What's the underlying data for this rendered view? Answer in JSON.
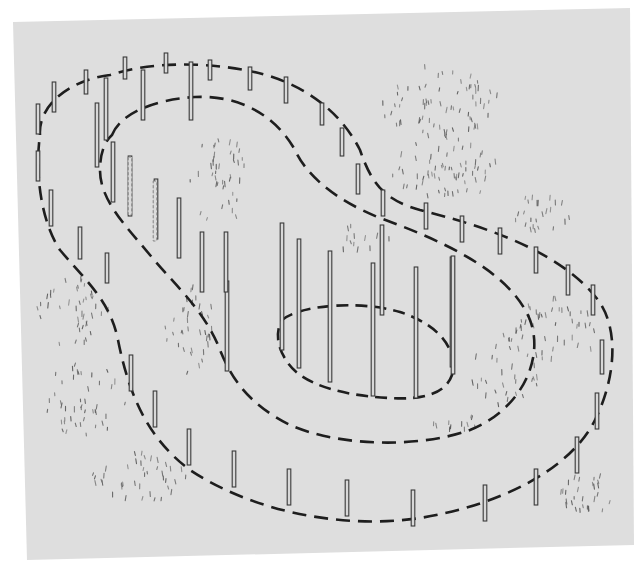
{
  "figure": {
    "kind": "contour-stake-diagram",
    "colors": {
      "page": "#ffffff",
      "panel": "#dedede",
      "line": "#1e1e1e",
      "pole_fill": "#d8d8d8",
      "pole_stroke": "#3a3a3a",
      "tuft": "#5a5a5a"
    }
  },
  "panel": {
    "corners": [
      [
        13,
        22
      ],
      [
        630,
        8
      ],
      [
        634,
        545
      ],
      [
        27,
        560
      ]
    ]
  },
  "contours": [
    {
      "name": "outer-contour",
      "dash": "14 8",
      "path": "M 40 135 C 38 105, 70 80, 110 75 C 150 62, 200 62, 245 70 C 300 80, 340 110, 360 150 C 372 185, 385 200, 420 210 C 480 225, 560 250, 598 300 C 620 330, 615 380, 595 420 C 570 470, 500 505, 420 518 C 340 530, 250 510, 190 470 C 150 440, 130 400, 118 340 C 110 300, 85 280, 60 250 C 40 220, 35 170, 40 135 Z"
    },
    {
      "name": "middle-contour",
      "dash": "14 8",
      "path": "M 112 135 C 120 115, 150 100, 195 97 C 240 95, 275 115, 295 150 C 305 172, 330 198, 380 218 C 440 240, 510 270, 530 320 C 545 360, 520 410, 470 430 C 420 448, 340 447, 290 425 C 250 405, 232 380, 220 350 C 205 310, 170 280, 150 255 C 125 225, 100 200, 100 170 C 100 155, 104 142, 112 135 Z"
    },
    {
      "name": "inner-contour",
      "dash": "12 7",
      "path": "M 282 320 C 300 305, 360 300, 400 312 C 440 325, 458 350, 452 375 C 445 395, 420 400, 390 398 C 345 396, 300 385, 286 360 C 276 345, 276 330, 282 320 Z"
    }
  ],
  "poles": {
    "outer": [
      [
        38,
        104,
        30
      ],
      [
        54,
        82,
        30
      ],
      [
        86,
        70,
        24
      ],
      [
        125,
        57,
        22
      ],
      [
        166,
        53,
        20
      ],
      [
        210,
        60,
        20
      ],
      [
        250,
        67,
        23
      ],
      [
        286,
        77,
        26
      ],
      [
        322,
        103,
        22
      ],
      [
        342,
        128,
        28
      ],
      [
        358,
        164,
        30
      ],
      [
        383,
        190,
        26
      ],
      [
        426,
        203,
        26
      ],
      [
        462,
        216,
        26
      ],
      [
        500,
        228,
        26
      ],
      [
        536,
        247,
        26
      ],
      [
        568,
        265,
        30
      ],
      [
        593,
        285,
        30
      ],
      [
        602,
        340,
        34
      ],
      [
        597,
        393,
        36
      ],
      [
        577,
        437,
        36
      ],
      [
        536,
        469,
        36
      ],
      [
        485,
        485,
        36
      ],
      [
        413,
        490,
        36
      ],
      [
        347,
        480,
        36
      ],
      [
        289,
        469,
        36
      ],
      [
        234,
        451,
        36
      ],
      [
        189,
        429,
        36
      ],
      [
        155,
        391,
        36
      ],
      [
        131,
        355,
        36
      ],
      [
        107,
        253,
        30
      ],
      [
        80,
        227,
        32
      ],
      [
        51,
        190,
        36
      ],
      [
        38,
        151,
        30
      ]
    ],
    "middle": [
      [
        106,
        78,
        62
      ],
      [
        143,
        70,
        50
      ],
      [
        191,
        62,
        58
      ],
      [
        97,
        103,
        64
      ],
      [
        113,
        142,
        60
      ],
      [
        130,
        156,
        60
      ],
      [
        156,
        179,
        60
      ],
      [
        179,
        198,
        60
      ],
      [
        202,
        232,
        60
      ],
      [
        227,
        281,
        90
      ],
      [
        382,
        225,
        90
      ],
      [
        452,
        257,
        110
      ],
      [
        226,
        232,
        60
      ]
    ],
    "inner": [
      [
        282,
        223,
        127
      ],
      [
        299,
        239,
        129
      ],
      [
        330,
        251,
        131
      ],
      [
        373,
        263,
        133
      ],
      [
        416,
        267,
        131
      ],
      [
        453,
        256,
        118
      ]
    ],
    "faint": [
      [
        130,
        157,
        58
      ],
      [
        155,
        181,
        60
      ]
    ]
  },
  "tufts": [
    {
      "cx": 440,
      "cy": 105,
      "rx": 60,
      "ry": 38,
      "n": 70
    },
    {
      "cx": 445,
      "cy": 170,
      "rx": 58,
      "ry": 30,
      "n": 60
    },
    {
      "cx": 540,
      "cy": 215,
      "rx": 35,
      "ry": 18,
      "n": 24
    },
    {
      "cx": 220,
      "cy": 185,
      "rx": 30,
      "ry": 50,
      "n": 40
    },
    {
      "cx": 75,
      "cy": 315,
      "rx": 38,
      "ry": 35,
      "n": 40
    },
    {
      "cx": 85,
      "cy": 400,
      "rx": 40,
      "ry": 40,
      "n": 45
    },
    {
      "cx": 140,
      "cy": 480,
      "rx": 50,
      "ry": 25,
      "n": 40
    },
    {
      "cx": 190,
      "cy": 330,
      "rx": 25,
      "ry": 45,
      "n": 35
    },
    {
      "cx": 505,
      "cy": 370,
      "rx": 35,
      "ry": 40,
      "n": 35
    },
    {
      "cx": 560,
      "cy": 330,
      "rx": 40,
      "ry": 35,
      "n": 40
    },
    {
      "cx": 455,
      "cy": 424,
      "rx": 25,
      "ry": 8,
      "n": 12
    },
    {
      "cx": 585,
      "cy": 495,
      "rx": 30,
      "ry": 22,
      "n": 28
    },
    {
      "cx": 362,
      "cy": 240,
      "rx": 30,
      "ry": 15,
      "n": 14
    }
  ]
}
